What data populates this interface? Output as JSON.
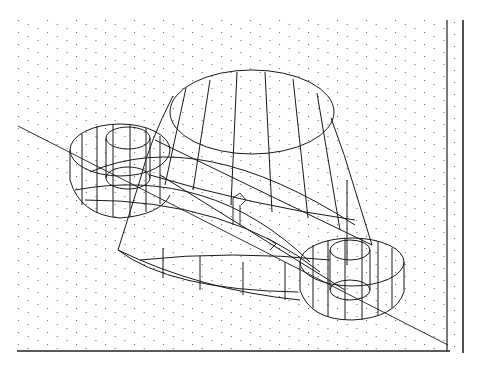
{
  "app": {
    "view_type": "3D wireframe model viewport",
    "background_color": "#ffffff",
    "line_color": "#1a1a1a",
    "grid_dot_color": "#777777"
  },
  "viewport": {
    "grid": {
      "style": "isometric-dots",
      "visible": true
    },
    "ucs_icon": {
      "name": "ucs-icon",
      "visible": true
    },
    "model": {
      "description": "Connecting-rod style part: large central tapered boss with two smaller cylindrical bosses joined by a web",
      "parts": [
        {
          "name": "central-tapered-boss"
        },
        {
          "name": "left-small-boss"
        },
        {
          "name": "left-inner-hole"
        },
        {
          "name": "right-small-boss"
        },
        {
          "name": "right-inner-hole"
        },
        {
          "name": "connecting-web"
        },
        {
          "name": "construction-line"
        }
      ]
    },
    "borders": {
      "bottom": true,
      "right": true
    }
  }
}
